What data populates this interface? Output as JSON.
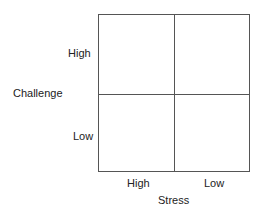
{
  "diagram": {
    "type": "2x2 matrix",
    "y_axis": {
      "title": "Challenge",
      "ticks": [
        "High",
        "Low"
      ]
    },
    "x_axis": {
      "title": "Stress",
      "ticks": [
        "High",
        "Low"
      ]
    },
    "line_color": "#555555"
  }
}
